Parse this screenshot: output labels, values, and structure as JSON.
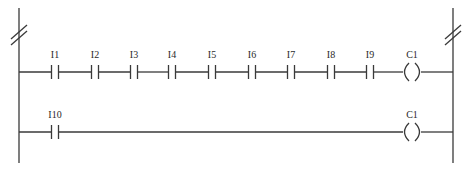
{
  "diagram": {
    "type": "ladder-logic",
    "rails": {
      "left_x": 19,
      "right_x": 453,
      "top_y": 8,
      "bottom_y": 163,
      "break_marks": true
    },
    "rungs": [
      {
        "y": 72,
        "contacts": [
          {
            "label": "I1",
            "x": 55
          },
          {
            "label": "I2",
            "x": 95
          },
          {
            "label": "I3",
            "x": 134
          },
          {
            "label": "I4",
            "x": 172
          },
          {
            "label": "I5",
            "x": 212
          },
          {
            "label": "I6",
            "x": 252
          },
          {
            "label": "I7",
            "x": 291
          },
          {
            "label": "I8",
            "x": 331
          },
          {
            "label": "I9",
            "x": 370
          }
        ],
        "coil": {
          "label": "C1",
          "x": 412
        }
      },
      {
        "y": 132,
        "contacts": [
          {
            "label": "I10",
            "x": 55
          }
        ],
        "coil": {
          "label": "C1",
          "x": 412
        }
      }
    ]
  },
  "colors": {
    "line": "#3a3a3a",
    "text": "#2a2a2a",
    "background": "#ffffff"
  }
}
